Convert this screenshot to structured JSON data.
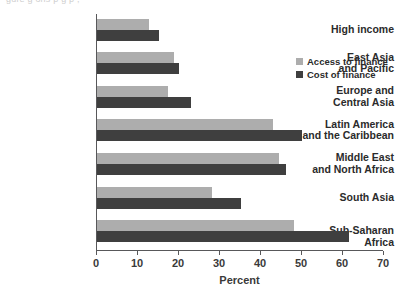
{
  "figure": {
    "cropped_title_fragment": "gure     g         ons       p   g                    p ,",
    "background": "#ffffff"
  },
  "legend": {
    "position": "top-right",
    "entries": [
      {
        "label": "Access to finance",
        "color": "#adadad",
        "swatch": "square-swatch"
      },
      {
        "label": "Cost of finance",
        "color": "#3f3f3f",
        "swatch": "square-swatch"
      }
    ]
  },
  "axis": {
    "x": {
      "label": "Percent",
      "ticks": [
        0,
        10,
        20,
        30,
        40,
        50,
        60,
        70
      ],
      "min": 0,
      "max": 70
    }
  },
  "chart_data": {
    "type": "bar",
    "orientation": "horizontal",
    "title": "",
    "xlabel": "Percent",
    "ylabel": "",
    "xlim": [
      0,
      70
    ],
    "grid": false,
    "legend_position": "top-right",
    "categories": [
      "High income",
      "East Asia and Pacific",
      "Europe and Central Asia",
      "Latin America and the Caribbean",
      "Middle East and North Africa",
      "South Asia",
      "Sub-Saharan Africa"
    ],
    "category_lines": [
      [
        "High income"
      ],
      [
        "East Asia",
        "and Pacific"
      ],
      [
        "Europe and",
        "Central Asia"
      ],
      [
        "Latin America",
        "and the Caribbean"
      ],
      [
        "Middle East",
        "and North Africa"
      ],
      [
        "South Asia"
      ],
      [
        "Sub-Saharan Africa"
      ]
    ],
    "series": [
      {
        "name": "Access to finance",
        "color": "#adadad",
        "values": [
          12.7,
          18.8,
          17.3,
          43.0,
          44.5,
          28.0,
          48.0
        ]
      },
      {
        "name": "Cost of finance",
        "color": "#3f3f3f",
        "values": [
          15.2,
          20.0,
          23.0,
          50.0,
          46.0,
          35.0,
          61.5
        ]
      }
    ]
  }
}
